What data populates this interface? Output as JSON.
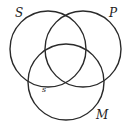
{
  "diagram": {
    "type": "venn-three-circle",
    "circles": [
      {
        "id": "S",
        "label": "S",
        "cx": 48,
        "cy": 49,
        "r": 38
      },
      {
        "id": "P",
        "label": "P",
        "cx": 83,
        "cy": 49,
        "r": 38
      },
      {
        "id": "M",
        "label": "M",
        "cx": 66,
        "cy": 82,
        "r": 38
      }
    ],
    "marks": [
      {
        "label": "s",
        "x": 43,
        "y": 91
      }
    ],
    "labels": {
      "S": {
        "text": "S",
        "x": 15,
        "y": 16
      },
      "P": {
        "text": "P",
        "x": 109,
        "y": 16
      },
      "M": {
        "text": "M",
        "x": 96,
        "y": 119
      }
    },
    "stroke_color": "#2a2a2a"
  }
}
